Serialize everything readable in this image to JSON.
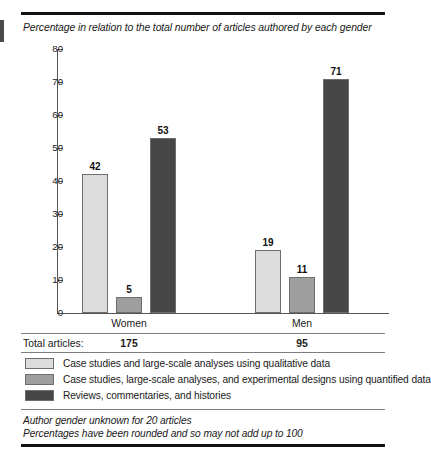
{
  "figure": {
    "caption": "Percentage in relation to the total number of articles authored by each gender",
    "totals_label": "Total articles:",
    "footnotes": [
      "Author gender unknown for 20 articles",
      "Percentages have been rounded and so may not add up to 100"
    ]
  },
  "colors": {
    "series_light": "#dcdcdc",
    "series_medium": "#9e9e9e",
    "series_dark": "#474747",
    "bar_outline": "#6e6e6e",
    "rule": "#111111",
    "thin_rule": "#7d7d7d",
    "text": "#1a1a1a"
  },
  "chart_data": {
    "type": "bar",
    "title": "Percentage in relation to the total number of articles authored by each gender",
    "xlabel": "",
    "ylabel": "",
    "ylim": [
      0,
      80
    ],
    "yticks": [
      0,
      10,
      20,
      30,
      40,
      50,
      60,
      70,
      80
    ],
    "ytick_labels": [
      "0",
      "10",
      "20",
      "30",
      "40",
      "50",
      "60",
      "70",
      "80"
    ],
    "grid": false,
    "legend_position": "below",
    "categories": [
      "Women",
      "Men"
    ],
    "series": [
      {
        "name": "Case studies and large-scale analyses using qualitative data",
        "color": "#dcdcdc",
        "values": [
          42,
          19
        ],
        "labels": [
          "42",
          "19"
        ]
      },
      {
        "name": "Case studies, large-scale analyses, and experimental designs using quantified data",
        "color": "#9e9e9e",
        "values": [
          5,
          11
        ],
        "labels": [
          "5",
          "11"
        ]
      },
      {
        "name": "Reviews, commentaries, and histories",
        "color": "#474747",
        "values": [
          53,
          71
        ],
        "labels": [
          "53",
          "71"
        ]
      }
    ],
    "totals": {
      "label": "Total articles:",
      "values": [
        "175",
        "95"
      ]
    },
    "annotations": [
      "Author gender unknown for 20 articles",
      "Percentages have been rounded and so may not add up to 100"
    ]
  }
}
